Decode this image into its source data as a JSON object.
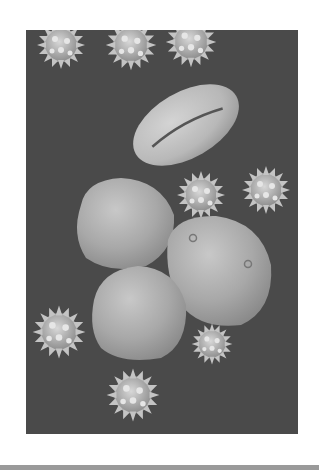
{
  "image": {
    "subject": "scanning electron micrograph of pollen grains",
    "background_color": "#4a4a4a",
    "grain_color": "#bdbdbd",
    "objects": [
      {
        "type": "spiky-pollen",
        "cx": 35,
        "cy": 15,
        "r": 22
      },
      {
        "type": "spiky-pollen",
        "cx": 105,
        "cy": 15,
        "r": 24
      },
      {
        "type": "spiky-pollen",
        "cx": 165,
        "cy": 12,
        "r": 24
      },
      {
        "type": "elongated-pollen",
        "cx": 160,
        "cy": 95,
        "rx": 58,
        "ry": 33,
        "rotate": -30
      },
      {
        "type": "spiky-pollen",
        "cx": 175,
        "cy": 165,
        "r": 24
      },
      {
        "type": "spiky-pollen",
        "cx": 240,
        "cy": 160,
        "r": 24
      },
      {
        "type": "smooth-pollen",
        "cx": 98,
        "cy": 192,
        "rx": 50,
        "ry": 45
      },
      {
        "type": "smooth-pollen",
        "cx": 193,
        "cy": 240,
        "rx": 52,
        "ry": 55
      },
      {
        "type": "smooth-pollen",
        "cx": 114,
        "cy": 278,
        "rx": 50,
        "ry": 52
      },
      {
        "type": "spiky-pollen",
        "cx": 33,
        "cy": 302,
        "r": 26
      },
      {
        "type": "spiky-pollen",
        "cx": 186,
        "cy": 314,
        "r": 20
      },
      {
        "type": "spiky-pollen",
        "cx": 107,
        "cy": 365,
        "r": 26
      }
    ]
  }
}
